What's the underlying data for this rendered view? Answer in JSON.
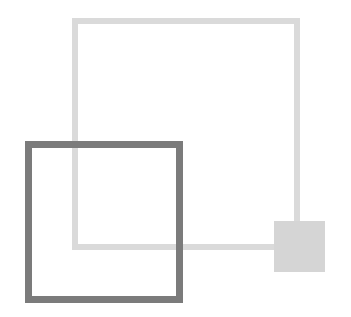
{
  "diagram": {
    "shapes": [
      {
        "id": "large-square",
        "type": "square-outline",
        "color": "#dadada",
        "x": 72,
        "y": 18,
        "width": 228,
        "height": 232,
        "stroke": 6
      },
      {
        "id": "small-filled-square",
        "type": "square-filled",
        "color": "#d5d5d5",
        "x": 274,
        "y": 221,
        "width": 51,
        "height": 51
      },
      {
        "id": "dark-square",
        "type": "square-outline",
        "color": "#7b7b7b",
        "x": 25,
        "y": 141,
        "width": 158,
        "height": 162,
        "stroke": 7
      }
    ]
  }
}
